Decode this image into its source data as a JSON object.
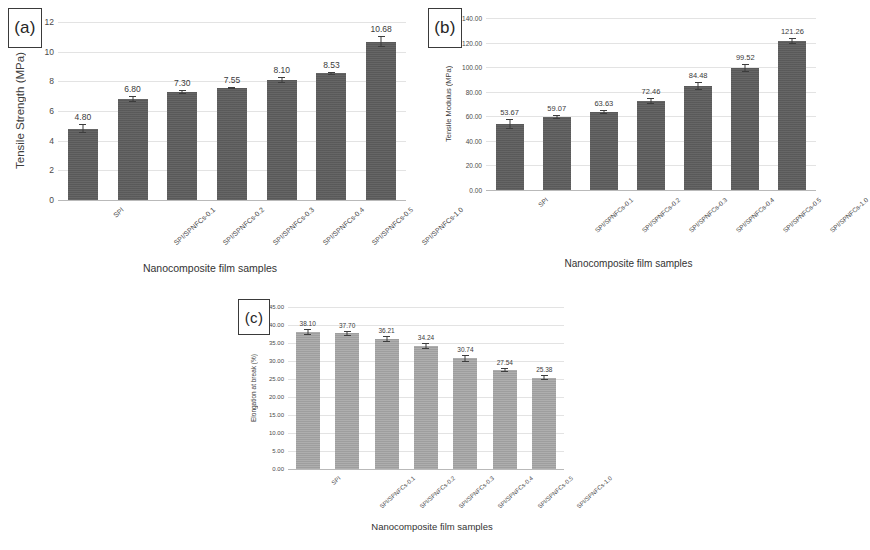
{
  "figure": {
    "background": "#ffffff",
    "panel_tags": {
      "a": "(a)",
      "b": "(b)",
      "c": "(c)"
    }
  },
  "chart_data": [
    {
      "id": "a",
      "type": "bar",
      "title": "",
      "panel_label": "(a)",
      "xlabel": "Nanocomposite film samples",
      "ylabel": "Tensile Strength (MPa)",
      "ylim": [
        0,
        12
      ],
      "yticks": [
        "12",
        "10",
        "8",
        "6",
        "4",
        "2",
        "0"
      ],
      "ytick_values": [
        12,
        10,
        8,
        6,
        4,
        2,
        0
      ],
      "grid": true,
      "legend": "none",
      "bar_color": "#5e5e5e",
      "categories": [
        "SPI",
        "SPI/SPNFCs-0.1",
        "SPI/SPNFCs-0.2",
        "SPI/SPNFCs-0.3",
        "SPI/SPNFCs-0.4",
        "SPI/SPNFCs-0.5",
        "SPI/SPNFCs-1.0"
      ],
      "values": [
        4.8,
        6.8,
        7.3,
        7.55,
        8.1,
        8.53,
        10.68
      ],
      "value_labels": [
        "4.80",
        "6.80",
        "7.30",
        "7.55",
        "8.10",
        "8.53",
        "10.68"
      ],
      "errors": [
        0.3,
        0.22,
        0.13,
        0.09,
        0.18,
        0.12,
        0.38
      ]
    },
    {
      "id": "b",
      "type": "bar",
      "title": "",
      "panel_label": "(b)",
      "xlabel": "Nanocomposite film samples",
      "ylabel": "Tensile Modulus (MPa)",
      "ylim": [
        0,
        140
      ],
      "yticks": [
        "140.00",
        "120.00",
        "100.00",
        "80.00",
        "60.00",
        "40.00",
        "20.00",
        "0.00"
      ],
      "ytick_values": [
        140,
        120,
        100,
        80,
        60,
        40,
        20,
        0
      ],
      "grid": true,
      "legend": "none",
      "bar_color": "#5e5e5e",
      "categories": [
        "SPI",
        "SPI/SPNFCs-0.1",
        "SPI/SPNFCs-0.2",
        "SPI/SPNFCs-0.3",
        "SPI/SPNFCs-0.4",
        "SPI/SPNFCs-0.5",
        "SPI/SPNFCs-1.0"
      ],
      "values": [
        53.67,
        59.07,
        63.63,
        72.46,
        84.48,
        99.52,
        121.26
      ],
      "value_labels": [
        "53.67",
        "59.07",
        "63.63",
        "72.46",
        "84.48",
        "99.52",
        "121.26"
      ],
      "errors": [
        4.2,
        1.6,
        1.5,
        2.6,
        3.2,
        3.1,
        2.6
      ]
    },
    {
      "id": "c",
      "type": "bar",
      "title": "",
      "panel_label": "(c)",
      "xlabel": "Nanocomposite film samples",
      "ylabel": "Elongation at break (%)",
      "ylim": [
        0,
        45
      ],
      "yticks": [
        "45.00",
        "40.00",
        "35.00",
        "30.00",
        "25.00",
        "20.00",
        "15.00",
        "10.00",
        "5.00",
        "0.00"
      ],
      "ytick_values": [
        45,
        40,
        35,
        30,
        25,
        20,
        15,
        10,
        5,
        0
      ],
      "grid": true,
      "legend": "none",
      "bar_color": "#a6a6a6",
      "categories": [
        "SPI",
        "SPI/SPNFCs-0.1",
        "SPI/SPNFCs-0.2",
        "SPI/SPNFCs-0.3",
        "SPI/SPNFCs-0.4",
        "SPI/SPNFCs-0.5",
        "SPI/SPNFCs-1.0"
      ],
      "values": [
        38.1,
        37.7,
        36.21,
        34.24,
        30.74,
        27.54,
        25.38
      ],
      "value_labels": [
        "38.10",
        "37.70",
        "36.21",
        "34.24",
        "30.74",
        "27.54",
        "25.38"
      ],
      "errors": [
        0.9,
        0.7,
        0.8,
        0.8,
        0.9,
        0.6,
        0.6
      ]
    }
  ]
}
